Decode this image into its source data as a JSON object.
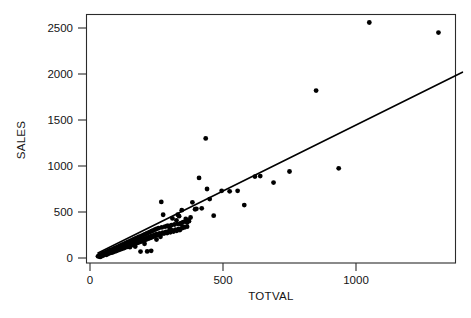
{
  "chart_data": {
    "type": "scatter",
    "title": "",
    "xlabel": "TOTVAL",
    "ylabel": "SALES",
    "xlim": [
      0,
      1400
    ],
    "ylim": [
      0,
      2650
    ],
    "xticks": [
      0,
      500,
      1000
    ],
    "yticks": [
      0,
      500,
      1000,
      1500,
      2000,
      2500
    ],
    "xtick_labels": [
      "0",
      "500",
      "1000"
    ],
    "ytick_labels": [
      "0",
      "500",
      "1000",
      "1500",
      "2000",
      "2500"
    ],
    "grid": false,
    "legend": "none",
    "point_color": "#000000",
    "line_color": "#000000",
    "frame_color": "#2b2b2b",
    "series": [
      {
        "name": "observations",
        "marker": "filled-circle",
        "points": [
          [
            30,
            18
          ],
          [
            34,
            22
          ],
          [
            36,
            30
          ],
          [
            38,
            12
          ],
          [
            40,
            26
          ],
          [
            42,
            40
          ],
          [
            44,
            20
          ],
          [
            46,
            34
          ],
          [
            48,
            48
          ],
          [
            50,
            28
          ],
          [
            52,
            55
          ],
          [
            54,
            38
          ],
          [
            56,
            44
          ],
          [
            58,
            62
          ],
          [
            60,
            50
          ],
          [
            62,
            35
          ],
          [
            64,
            70
          ],
          [
            66,
            58
          ],
          [
            68,
            46
          ],
          [
            70,
            76
          ],
          [
            72,
            64
          ],
          [
            74,
            52
          ],
          [
            76,
            84
          ],
          [
            78,
            68
          ],
          [
            80,
            58
          ],
          [
            82,
            92
          ],
          [
            84,
            74
          ],
          [
            86,
            62
          ],
          [
            88,
            100
          ],
          [
            90,
            80
          ],
          [
            92,
            70
          ],
          [
            94,
            108
          ],
          [
            96,
            86
          ],
          [
            98,
            76
          ],
          [
            100,
            116
          ],
          [
            102,
            94
          ],
          [
            104,
            82
          ],
          [
            106,
            124
          ],
          [
            108,
            100
          ],
          [
            110,
            90
          ],
          [
            112,
            132
          ],
          [
            114,
            106
          ],
          [
            116,
            96
          ],
          [
            118,
            140
          ],
          [
            120,
            112
          ],
          [
            122,
            102
          ],
          [
            124,
            148
          ],
          [
            126,
            120
          ],
          [
            128,
            108
          ],
          [
            130,
            156
          ],
          [
            132,
            126
          ],
          [
            134,
            116
          ],
          [
            136,
            164
          ],
          [
            138,
            132
          ],
          [
            140,
            122
          ],
          [
            142,
            172
          ],
          [
            144,
            140
          ],
          [
            146,
            128
          ],
          [
            148,
            180
          ],
          [
            150,
            146
          ],
          [
            152,
            136
          ],
          [
            154,
            188
          ],
          [
            156,
            152
          ],
          [
            158,
            142
          ],
          [
            160,
            196
          ],
          [
            162,
            160
          ],
          [
            164,
            148
          ],
          [
            166,
            204
          ],
          [
            168,
            166
          ],
          [
            170,
            156
          ],
          [
            172,
            212
          ],
          [
            174,
            172
          ],
          [
            176,
            162
          ],
          [
            178,
            220
          ],
          [
            180,
            180
          ],
          [
            182,
            168
          ],
          [
            184,
            228
          ],
          [
            186,
            186
          ],
          [
            188,
            176
          ],
          [
            190,
            236
          ],
          [
            192,
            192
          ],
          [
            194,
            182
          ],
          [
            196,
            244
          ],
          [
            198,
            200
          ],
          [
            200,
            190
          ],
          [
            202,
            252
          ],
          [
            204,
            206
          ],
          [
            206,
            196
          ],
          [
            208,
            260
          ],
          [
            210,
            214
          ],
          [
            212,
            202
          ],
          [
            214,
            268
          ],
          [
            216,
            220
          ],
          [
            218,
            210
          ],
          [
            220,
            276
          ],
          [
            222,
            226
          ],
          [
            224,
            216
          ],
          [
            226,
            284
          ],
          [
            228,
            234
          ],
          [
            230,
            222
          ],
          [
            232,
            292
          ],
          [
            234,
            240
          ],
          [
            236,
            230
          ],
          [
            238,
            300
          ],
          [
            240,
            246
          ],
          [
            242,
            236
          ],
          [
            244,
            308
          ],
          [
            246,
            254
          ],
          [
            248,
            244
          ],
          [
            250,
            316
          ],
          [
            252,
            260
          ],
          [
            254,
            250
          ],
          [
            258,
            324
          ],
          [
            262,
            268
          ],
          [
            266,
            258
          ],
          [
            270,
            332
          ],
          [
            274,
            276
          ],
          [
            278,
            266
          ],
          [
            282,
            340
          ],
          [
            286,
            284
          ],
          [
            290,
            272
          ],
          [
            294,
            348
          ],
          [
            298,
            292
          ],
          [
            302,
            280
          ],
          [
            306,
            356
          ],
          [
            310,
            300
          ],
          [
            314,
            288
          ],
          [
            318,
            364
          ],
          [
            322,
            308
          ],
          [
            326,
            296
          ],
          [
            330,
            372
          ],
          [
            334,
            316
          ],
          [
            338,
            304
          ],
          [
            342,
            380
          ],
          [
            346,
            324
          ],
          [
            350,
            390
          ],
          [
            355,
            332
          ],
          [
            360,
            400
          ],
          [
            365,
            340
          ],
          [
            370,
            410
          ],
          [
            190,
            70
          ],
          [
            215,
            72
          ],
          [
            230,
            78
          ],
          [
            150,
            118
          ],
          [
            170,
            125
          ],
          [
            205,
            155
          ],
          [
            250,
            200
          ],
          [
            265,
            230
          ],
          [
            275,
            470
          ],
          [
            290,
            350
          ],
          [
            300,
            318
          ],
          [
            310,
            430
          ],
          [
            325,
            410
          ],
          [
            335,
            455
          ],
          [
            340,
            370
          ],
          [
            345,
            520
          ],
          [
            350,
            340
          ],
          [
            360,
            425
          ],
          [
            365,
            385
          ],
          [
            372,
            400
          ],
          [
            378,
            440
          ],
          [
            268,
            610
          ],
          [
            330,
            470
          ],
          [
            385,
            605
          ],
          [
            395,
            530
          ],
          [
            400,
            535
          ],
          [
            410,
            870
          ],
          [
            420,
            540
          ],
          [
            435,
            1300
          ],
          [
            440,
            750
          ],
          [
            450,
            640
          ],
          [
            465,
            460
          ],
          [
            495,
            730
          ],
          [
            525,
            725
          ],
          [
            555,
            730
          ],
          [
            580,
            575
          ],
          [
            620,
            885
          ],
          [
            640,
            890
          ],
          [
            690,
            820
          ],
          [
            750,
            940
          ],
          [
            850,
            1820
          ],
          [
            935,
            975
          ],
          [
            1050,
            2560
          ],
          [
            1310,
            2450
          ]
        ]
      }
    ],
    "fit_line": {
      "name": "regression-line",
      "x_start": 30,
      "y_start": 55,
      "x_end": 1400,
      "y_end": 2020
    }
  },
  "axes": {
    "x_title": "TOTVAL",
    "y_title": "SALES"
  }
}
